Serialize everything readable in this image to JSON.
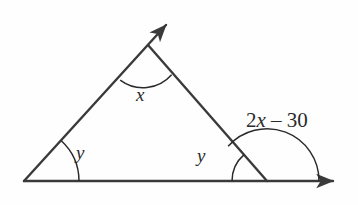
{
  "figure": {
    "kind": "geometry-diagram",
    "background_color": "#fefefe",
    "stroke_color": "#3a3a3a",
    "text_color": "#2b2b2b",
    "width": 358,
    "height": 205
  },
  "labels": {
    "apex_angle": "x",
    "left_base_angle": "y",
    "right_interior_angle": "y",
    "exterior_angle_prefix": "2",
    "exterior_angle_var": "x",
    "exterior_angle_suffix": " – 30",
    "exterior_angle_full": "2x – 30"
  },
  "geometry": {
    "vertices": {
      "left_base": [
        24,
        181
      ],
      "apex": [
        148,
        45
      ],
      "right_base": [
        267,
        181
      ]
    },
    "rays": {
      "apex_ray_tip": [
        170,
        10
      ],
      "baseline_ray_tip": [
        340,
        181
      ]
    },
    "arcs": {
      "apex_arc_radius": 38,
      "left_arc_radius": 55,
      "right_interior_arc_radius": 35,
      "exterior_arc_radius": 52
    }
  }
}
